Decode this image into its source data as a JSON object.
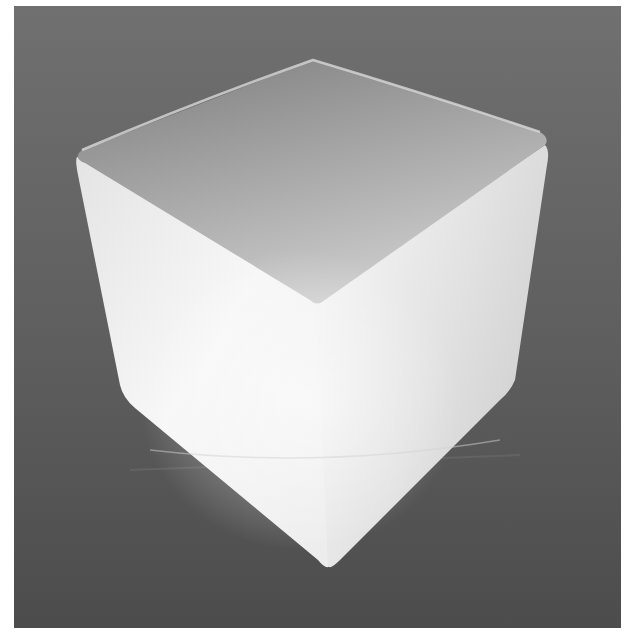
{
  "image": {
    "subject": "white cube on dark gray background",
    "style": "grayscale photograph",
    "colors": {
      "border": "#ffffff",
      "background_top": "#6e6e6e",
      "background_bottom": "#4a4a4a",
      "top_face_light": "#c8c8c8",
      "top_face_dark": "#8f8f8f",
      "left_face": "#f2f2f2",
      "right_face": "#e6e6e6"
    }
  }
}
